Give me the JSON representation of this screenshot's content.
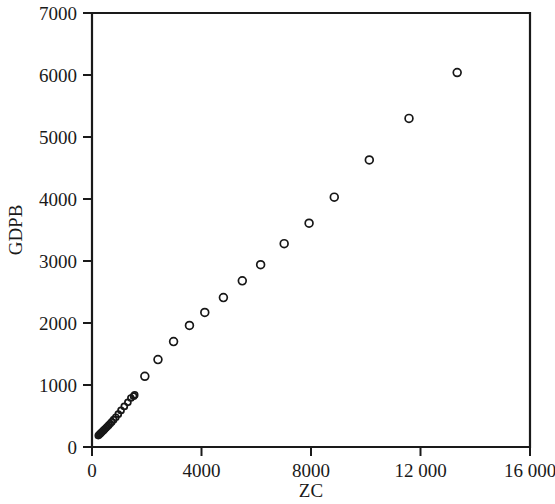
{
  "chart_data": {
    "type": "scatter",
    "title": "",
    "xlabel": "ZC",
    "ylabel": "GDPB",
    "xlim": [
      0,
      16000
    ],
    "ylim": [
      0,
      7000
    ],
    "grid": false,
    "legend": null,
    "x_ticks": [
      0,
      4000,
      8000,
      12000,
      16000
    ],
    "x_tick_labels": [
      "0",
      "4000",
      "8000",
      "12 000",
      "16 000"
    ],
    "y_ticks": [
      0,
      1000,
      2000,
      3000,
      4000,
      5000,
      6000,
      7000
    ],
    "y_tick_labels": [
      "0",
      "1000",
      "2000",
      "3000",
      "4000",
      "5000",
      "6000",
      "7000"
    ],
    "marker": "open-circle",
    "marker_color": "#171717",
    "series": [
      {
        "name": "GDPB vs ZC",
        "points": [
          [
            230,
            185
          ],
          [
            265,
            200
          ],
          [
            300,
            215
          ],
          [
            330,
            228
          ],
          [
            360,
            242
          ],
          [
            395,
            258
          ],
          [
            430,
            272
          ],
          [
            470,
            290
          ],
          [
            515,
            310
          ],
          [
            560,
            330
          ],
          [
            610,
            352
          ],
          [
            665,
            378
          ],
          [
            720,
            405
          ],
          [
            790,
            440
          ],
          [
            870,
            480
          ],
          [
            960,
            530
          ],
          [
            1060,
            590
          ],
          [
            1180,
            655
          ],
          [
            1310,
            720
          ],
          [
            1420,
            790
          ],
          [
            1520,
            820
          ],
          [
            1560,
            840
          ],
          [
            1930,
            1140
          ],
          [
            2410,
            1410
          ],
          [
            2980,
            1700
          ],
          [
            3560,
            1960
          ],
          [
            4120,
            2170
          ],
          [
            4800,
            2410
          ],
          [
            5490,
            2680
          ],
          [
            6160,
            2940
          ],
          [
            7020,
            3280
          ],
          [
            7930,
            3610
          ],
          [
            8850,
            4030
          ],
          [
            10130,
            4630
          ],
          [
            11580,
            5300
          ],
          [
            13340,
            6040
          ]
        ]
      }
    ]
  },
  "axis_titles": {
    "x": "ZC",
    "y": "GDPB"
  }
}
